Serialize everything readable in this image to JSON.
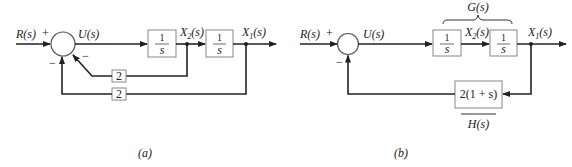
{
  "diagram_a": {
    "caption": "(a)",
    "input_label": "R(s)",
    "plus_sign": "+",
    "minus_inner": "−",
    "minus_outer": "−",
    "u_label": "U(s)",
    "block1": {
      "num": "1",
      "den": "s"
    },
    "block2": {
      "num": "1",
      "den": "s"
    },
    "x2_label": "X",
    "x2_sub": "2",
    "x1_label": "X",
    "x1_sub": "1",
    "sig_suffix": "(s)",
    "inner_gain": "2",
    "outer_gain": "2"
  },
  "diagram_b": {
    "caption": "(b)",
    "input_label": "R(s)",
    "plus_sign": "+",
    "minus_sign": "−",
    "u_label": "U(s)",
    "g_label": "G(s)",
    "block1": {
      "num": "1",
      "den": "s"
    },
    "block2": {
      "num": "1",
      "den": "s"
    },
    "x2_label": "X",
    "x2_sub": "2",
    "x1_label": "X",
    "x1_sub": "1",
    "sig_suffix": "(s)",
    "feedback_block": "2(1 + s)",
    "h_label": "H(s)"
  }
}
